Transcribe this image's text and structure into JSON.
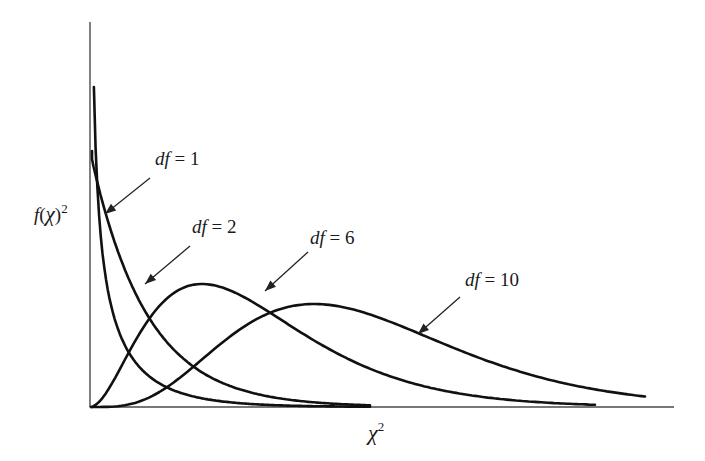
{
  "chart_data": {
    "type": "line",
    "title": "",
    "xlabel": "χ²",
    "ylabel": "f(χ)²",
    "grid": false,
    "legend_position": "none (inline arrow annotations)",
    "x_ticks": [],
    "y_ticks": [],
    "series": [
      {
        "name": "df = 1",
        "df": 1,
        "label": "df = 1",
        "peak_x_px": 92,
        "peak_y_px": 87,
        "end_x_px": 370
      },
      {
        "name": "df = 2",
        "df": 2,
        "label": "df = 2",
        "peak_x_px": 92,
        "peak_y_px": 151,
        "end_x_px": 370
      },
      {
        "name": "df = 6",
        "df": 6,
        "label": "df = 6",
        "peak_x_px": 220,
        "peak_y_px": 284,
        "end_x_px": 595
      },
      {
        "name": "df = 10",
        "df": 10,
        "label": "df = 10",
        "peak_x_px": 310,
        "peak_y_px": 304,
        "end_x_px": 645
      }
    ],
    "annotations": [
      {
        "text": "df = 1",
        "text_x": 155,
        "text_y": 165,
        "arrow_from": [
          150,
          178
        ],
        "arrow_to": [
          105,
          214
        ]
      },
      {
        "text": "df = 2",
        "text_x": 192,
        "text_y": 233,
        "arrow_from": [
          190,
          246
        ],
        "arrow_to": [
          145,
          284
        ]
      },
      {
        "text": "df = 6",
        "text_x": 310,
        "text_y": 244,
        "arrow_from": [
          308,
          252
        ],
        "arrow_to": [
          265,
          291
        ]
      },
      {
        "text": "df = 10",
        "text_x": 465,
        "text_y": 286,
        "arrow_from": [
          460,
          297
        ],
        "arrow_to": [
          418,
          334
        ]
      }
    ],
    "axes": {
      "origin_px": [
        90,
        407
      ],
      "y_axis_top_px": 22,
      "x_axis_right_px": 674
    }
  },
  "labels": {
    "x_axis": "χ",
    "x_axis_sup": "2",
    "y_axis_f": "f",
    "y_axis_open": "(",
    "y_axis_chi": "χ",
    "y_axis_close": ")",
    "y_axis_sup": "2"
  }
}
